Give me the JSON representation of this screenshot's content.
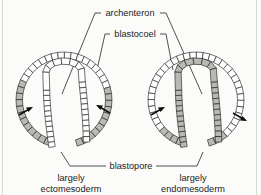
{
  "figure": {
    "title": "archenteron",
    "background_color": "#fbfbfa",
    "ink_color": "#1a1a1a",
    "shaded_cell_color": "#b9b9b4",
    "unshaded_cell_color": "#ffffff"
  },
  "labels": {
    "archenteron": "archenteron",
    "blastocoel": "blastocoel",
    "blastopore": "blastopore",
    "left_caption_line1": "largely",
    "left_caption_line2": "ectomesoderm",
    "right_caption_line1": "largely",
    "right_caption_line2": "endomesoderm"
  },
  "embryos": [
    {
      "id": "left-embryo",
      "name": "largely ectomesoderm embryo",
      "caption": "largely ectomesoderm",
      "outer_layer_shading": "gray on ventral/lower half",
      "inner_layer_shading": "unshaded (white)",
      "arrow_count": 2
    },
    {
      "id": "right-embryo",
      "name": "largely endomesoderm embryo",
      "caption": "largely endomesoderm",
      "outer_layer_shading": "unshaded except ventral base",
      "inner_layer_shading": "gray (shaded)",
      "arrow_count": 2
    }
  ],
  "annotations": {
    "arrows": "inward-pointing involution arrows at blastopore lips"
  }
}
